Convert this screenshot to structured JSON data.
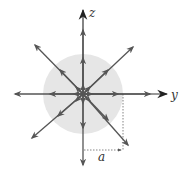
{
  "diagram": {
    "type": "radial-field",
    "center": [
      83,
      94
    ],
    "sphere": {
      "radius": 40,
      "fill": "#e6e6e6"
    },
    "axes": {
      "horizontal": {
        "label": "y",
        "from": [
          15,
          94
        ],
        "to": [
          167,
          94
        ]
      },
      "vertical": {
        "label": "z",
        "from": [
          83,
          165
        ],
        "to": [
          83,
          10
        ]
      }
    },
    "field_arrows": [
      {
        "direction": "left",
        "tip": [
          15,
          94
        ]
      },
      {
        "direction": "right",
        "tip": [
          150,
          94
        ]
      },
      {
        "direction": "up",
        "tip": [
          83,
          25
        ]
      },
      {
        "direction": "down",
        "tip": [
          83,
          165
        ]
      },
      {
        "direction": "up-left",
        "tip": [
          35,
          45
        ]
      },
      {
        "direction": "up-right",
        "tip": [
          133,
          47
        ]
      },
      {
        "direction": "down-left",
        "tip": [
          32,
          138
        ]
      },
      {
        "direction": "down-right",
        "tip": [
          128,
          145
        ]
      }
    ],
    "dimension": {
      "label": "a",
      "meaning": "radius of the sphere",
      "guide_x": 123,
      "guide_y": 150
    },
    "colors": {
      "arrow": "#555555",
      "axis": "#333333",
      "sphere": "#e6e6e6",
      "dotted": "#666666"
    }
  }
}
